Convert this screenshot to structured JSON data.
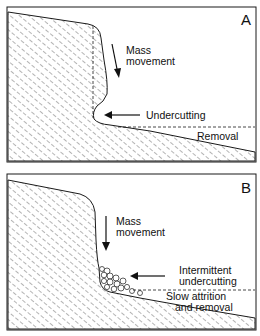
{
  "panels": [
    {
      "id": "A",
      "letter": "A",
      "labels": {
        "mass_movement_1": "Mass",
        "mass_movement_2": "movement",
        "undercutting": "Undercutting",
        "removal": "Removal"
      }
    },
    {
      "id": "B",
      "letter": "B",
      "labels": {
        "mass_movement_1": "Mass",
        "mass_movement_2": "movement",
        "undercutting_1": "Intermittent",
        "undercutting_2": "undercutting",
        "removal_1": "Slow attrition",
        "removal_2": "and removal"
      }
    }
  ],
  "colors": {
    "stroke": "#1a1a1a",
    "background": "#ffffff",
    "hatch": "#333333"
  }
}
